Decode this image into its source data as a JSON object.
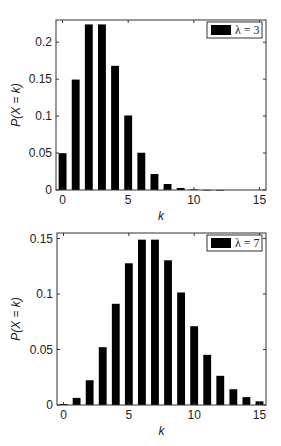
{
  "chart_data": [
    {
      "type": "bar",
      "title": "",
      "xlabel": "k",
      "ylabel": "P(X = k)",
      "legend": "λ = 3",
      "legend_position": "upper right",
      "grid": false,
      "xlim": [
        -0.5,
        15.5
      ],
      "ylim": [
        0,
        0.23
      ],
      "xticks": [
        0,
        5,
        10,
        15
      ],
      "yticks": [
        0,
        0.05,
        0.1,
        0.15,
        0.2
      ],
      "ytick_labels": [
        "0",
        "0.05",
        "0.1",
        "0.15",
        "0.2"
      ],
      "categories": [
        0,
        1,
        2,
        3,
        4,
        5,
        6,
        7,
        8,
        9,
        10,
        11,
        12,
        13,
        14,
        15
      ],
      "values": [
        0.0498,
        0.1494,
        0.224,
        0.224,
        0.168,
        0.1008,
        0.0504,
        0.0216,
        0.0081,
        0.0027,
        0.0008,
        0.0002,
        0.0001,
        0,
        0,
        0
      ],
      "bar_color": "#000000"
    },
    {
      "type": "bar",
      "title": "",
      "xlabel": "k",
      "ylabel": "P(X = k)",
      "legend": "λ = 7",
      "legend_position": "upper right",
      "grid": false,
      "xlim": [
        -0.5,
        15.5
      ],
      "ylim": [
        0,
        0.155
      ],
      "xticks": [
        0,
        5,
        10,
        15
      ],
      "yticks": [
        0,
        0.05,
        0.1,
        0.15
      ],
      "ytick_labels": [
        "0",
        "0.05",
        "0.1",
        "0.15"
      ],
      "categories": [
        0,
        1,
        2,
        3,
        4,
        5,
        6,
        7,
        8,
        9,
        10,
        11,
        12,
        13,
        14,
        15
      ],
      "values": [
        0.0009,
        0.0064,
        0.0223,
        0.0521,
        0.0912,
        0.1277,
        0.149,
        0.149,
        0.1304,
        0.1014,
        0.071,
        0.0452,
        0.0263,
        0.0142,
        0.0071,
        0.0033
      ],
      "bar_color": "#000000"
    }
  ]
}
